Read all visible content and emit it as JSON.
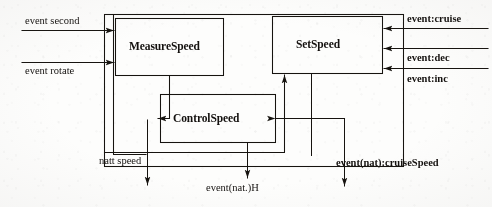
{
  "diagram": {
    "style": {
      "line_color": "#16130f",
      "text_color": "#14110f",
      "background": "#fdfdfc"
    },
    "container": {
      "name": "outer-boundary",
      "x": 104,
      "y": 14,
      "w": 299,
      "h": 152
    },
    "blocks": [
      {
        "id": "measure-speed",
        "label": "MeasureSpeed",
        "x": 115,
        "y": 18,
        "w": 108,
        "h": 57
      },
      {
        "id": "set-speed",
        "label": "SetSpeed",
        "x": 272,
        "y": 16,
        "w": 110,
        "h": 57
      },
      {
        "id": "control-speed",
        "label": "ControlSpeed",
        "x": 160,
        "y": 94,
        "w": 115,
        "h": 48
      }
    ],
    "inputs_left": [
      {
        "id": "event-second",
        "label": "event second",
        "y": 30
      },
      {
        "id": "event-rotate",
        "label": "event rotate",
        "y": 62
      }
    ],
    "inputs_right": [
      {
        "id": "event-cruise",
        "label": "event:cruise",
        "y": 28
      },
      {
        "id": "event-dec",
        "label": "event:dec",
        "y": 48
      },
      {
        "id": "event-inc",
        "label": "event:inc",
        "y": 68
      }
    ],
    "outputs_bottom": [
      {
        "id": "att-speed",
        "label": "natt speed",
        "x": 145,
        "arrow_x": 148
      },
      {
        "id": "event-nat-h",
        "label": "event(nat.)H",
        "x": 206,
        "arrow_x": 248
      },
      {
        "id": "event-nat-cruise",
        "label": "event(nat):cruiseSpeed",
        "x": 340,
        "arrow_x": 345
      }
    ]
  }
}
